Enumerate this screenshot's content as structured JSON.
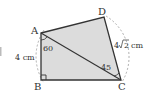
{
  "diagram": {
    "type": "geometry-quadrilateral",
    "points": {
      "A": {
        "label": "A",
        "x": 41,
        "y": 33
      },
      "B": {
        "label": "B",
        "x": 41,
        "y": 80
      },
      "C": {
        "label": "C",
        "x": 121,
        "y": 80
      },
      "D": {
        "label": "D",
        "x": 104,
        "y": 17
      }
    },
    "labels": {
      "A": "A",
      "B": "B",
      "C": "C",
      "D": "D",
      "AB_length": "4 cm",
      "DC_length_coef": "4",
      "DC_length_root": "2",
      "DC_length_unit": "cm",
      "angle_BAC": "60",
      "angle_ACD": "45"
    },
    "colors": {
      "fill": "#dcdcdc",
      "stroke": "#333333",
      "circle": "#888888"
    }
  }
}
